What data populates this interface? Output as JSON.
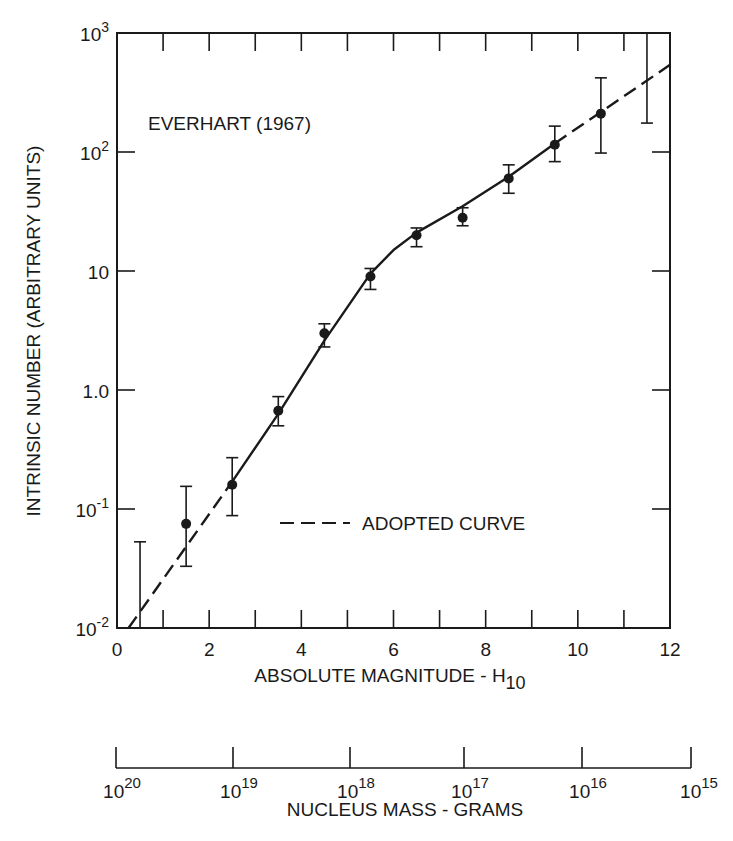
{
  "chart_data": {
    "type": "scatter",
    "title": "",
    "annotation": "EVERHART (1967)",
    "xlabel": "ABSOLUTE MAGNITUDE - H",
    "xlabel_subscript": "10",
    "ylabel": "INTRINSIC NUMBER (ARBITRARY UNITS)",
    "yscale": "log",
    "xlim": [
      0,
      12
    ],
    "ylim": [
      0.01,
      1000
    ],
    "x_ticks": [
      0,
      2,
      4,
      6,
      8,
      10,
      12
    ],
    "x_tick_labels": [
      "0",
      "2",
      "4",
      "6",
      "8",
      "10",
      "12"
    ],
    "y_ticks": [
      0.01,
      0.1,
      1,
      10,
      100,
      1000
    ],
    "y_tick_labels": [
      {
        "base": "10",
        "exp": "-2"
      },
      {
        "base": "10",
        "exp": "-1"
      },
      {
        "base": "1.0",
        "exp": ""
      },
      {
        "base": "10",
        "exp": ""
      },
      {
        "base": "10",
        "exp": "2"
      },
      {
        "base": "10",
        "exp": "3"
      }
    ],
    "grid": false,
    "legend": {
      "position": "inside-lower-right",
      "entries": [
        {
          "label": "ADOPTED CURVE",
          "style": "dashed"
        }
      ]
    },
    "series": [
      {
        "name": "Everhart (1967) data",
        "style": "points-with-error-bars",
        "points": [
          {
            "x": 0.5,
            "y": null,
            "err_high": 0.053,
            "err_low": 0.01
          },
          {
            "x": 1.5,
            "y": 0.075,
            "err_high": 0.155,
            "err_low": 0.033
          },
          {
            "x": 2.5,
            "y": 0.16,
            "err_high": 0.27,
            "err_low": 0.088
          },
          {
            "x": 3.5,
            "y": 0.67,
            "err_high": 0.88,
            "err_low": 0.5
          },
          {
            "x": 4.5,
            "y": 3.0,
            "err_high": 3.6,
            "err_low": 2.3
          },
          {
            "x": 5.5,
            "y": 9.0,
            "err_high": 10.5,
            "err_low": 7.0
          },
          {
            "x": 6.5,
            "y": 20,
            "err_high": 23,
            "err_low": 16
          },
          {
            "x": 7.5,
            "y": 28,
            "err_high": 34,
            "err_low": 24
          },
          {
            "x": 8.5,
            "y": 60,
            "err_high": 78,
            "err_low": 45
          },
          {
            "x": 9.5,
            "y": 115,
            "err_high": 165,
            "err_low": 83
          },
          {
            "x": 10.5,
            "y": 210,
            "err_high": 420,
            "err_low": 98
          },
          {
            "x": 11.5,
            "y": null,
            "err_high": 1000,
            "err_low": 175
          }
        ]
      },
      {
        "name": "Fitted curve",
        "style": "solid",
        "x": [
          2.5,
          3.5,
          4.5,
          5.5,
          6.0,
          6.5,
          7.5,
          8.5,
          9.5
        ],
        "y": [
          0.17,
          0.63,
          2.6,
          9.5,
          15,
          21,
          35,
          62,
          118
        ]
      },
      {
        "name": "ADOPTED CURVE",
        "style": "dashed",
        "segments": [
          {
            "x": [
              0.25,
              2.5
            ],
            "y": [
              0.01,
              0.17
            ]
          },
          {
            "x": [
              9.5,
              12.0
            ],
            "y": [
              118,
              540
            ]
          }
        ]
      }
    ],
    "secondary_x_axis": {
      "label": "NUCLEUS MASS - GRAMS",
      "scale": "log-reversed",
      "tick_labels": [
        {
          "base": "10",
          "exp": "20"
        },
        {
          "base": "10",
          "exp": "19"
        },
        {
          "base": "10",
          "exp": "18"
        },
        {
          "base": "10",
          "exp": "17"
        },
        {
          "base": "10",
          "exp": "16"
        },
        {
          "base": "10",
          "exp": "15"
        }
      ]
    }
  }
}
